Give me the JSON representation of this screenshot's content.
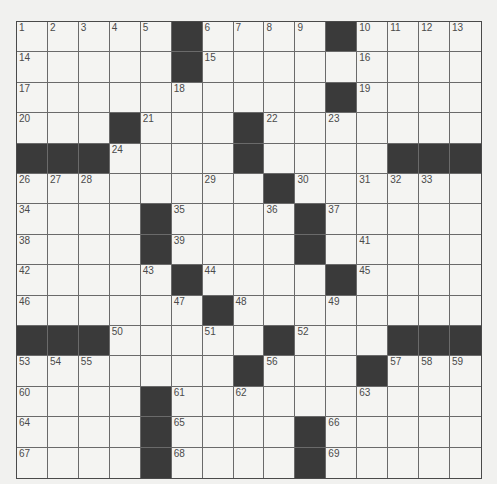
{
  "puzzle": {
    "rows": 15,
    "cols": 15,
    "colors": {
      "black_square": "#3a3a3a",
      "white_square": "#f4f4f2",
      "grid_line": "#6a6a6a",
      "number_text": "#4a4a4a"
    },
    "layout": [
      "#####.####.####",
      "#####.#########",
      "##########.####",
      "###.###.#######",
      "...####.####...",
      "########.######",
      "####.####.#####",
      "####.####.#####",
      "#####.####.####",
      "######.########",
      "...#####.###...",
      "#######.###.###",
      "####.##########",
      "####.####.#####",
      "####.####.#####"
    ],
    "numbers": [
      {
        "r": 0,
        "c": 0,
        "n": "1"
      },
      {
        "r": 0,
        "c": 1,
        "n": "2"
      },
      {
        "r": 0,
        "c": 2,
        "n": "3"
      },
      {
        "r": 0,
        "c": 3,
        "n": "4"
      },
      {
        "r": 0,
        "c": 4,
        "n": "5"
      },
      {
        "r": 0,
        "c": 6,
        "n": "6"
      },
      {
        "r": 0,
        "c": 7,
        "n": "7"
      },
      {
        "r": 0,
        "c": 8,
        "n": "8"
      },
      {
        "r": 0,
        "c": 9,
        "n": "9"
      },
      {
        "r": 0,
        "c": 11,
        "n": "10"
      },
      {
        "r": 0,
        "c": 12,
        "n": "11"
      },
      {
        "r": 0,
        "c": 13,
        "n": "12"
      },
      {
        "r": 0,
        "c": 14,
        "n": "13"
      },
      {
        "r": 1,
        "c": 0,
        "n": "14"
      },
      {
        "r": 1,
        "c": 6,
        "n": "15"
      },
      {
        "r": 1,
        "c": 11,
        "n": "16"
      },
      {
        "r": 2,
        "c": 0,
        "n": "17"
      },
      {
        "r": 2,
        "c": 5,
        "n": "18"
      },
      {
        "r": 2,
        "c": 11,
        "n": "19"
      },
      {
        "r": 3,
        "c": 0,
        "n": "20"
      },
      {
        "r": 3,
        "c": 4,
        "n": "21"
      },
      {
        "r": 3,
        "c": 8,
        "n": "22"
      },
      {
        "r": 3,
        "c": 10,
        "n": "23"
      },
      {
        "r": 4,
        "c": 3,
        "n": "24"
      },
      {
        "r": 4,
        "c": 7,
        "n": "25"
      },
      {
        "r": 5,
        "c": 0,
        "n": "26"
      },
      {
        "r": 5,
        "c": 1,
        "n": "27"
      },
      {
        "r": 5,
        "c": 2,
        "n": "28"
      },
      {
        "r": 5,
        "c": 6,
        "n": "29"
      },
      {
        "r": 5,
        "c": 9,
        "n": "30"
      },
      {
        "r": 5,
        "c": 11,
        "n": "31"
      },
      {
        "r": 5,
        "c": 12,
        "n": "32"
      },
      {
        "r": 5,
        "c": 13,
        "n": "33"
      },
      {
        "r": 6,
        "c": 0,
        "n": "34"
      },
      {
        "r": 6,
        "c": 5,
        "n": "35"
      },
      {
        "r": 6,
        "c": 8,
        "n": "36"
      },
      {
        "r": 6,
        "c": 10,
        "n": "37"
      },
      {
        "r": 7,
        "c": 0,
        "n": "38"
      },
      {
        "r": 7,
        "c": 5,
        "n": "39"
      },
      {
        "r": 7,
        "c": 9,
        "n": "40"
      },
      {
        "r": 7,
        "c": 11,
        "n": "41"
      },
      {
        "r": 8,
        "c": 0,
        "n": "42"
      },
      {
        "r": 8,
        "c": 4,
        "n": "43"
      },
      {
        "r": 8,
        "c": 6,
        "n": "44"
      },
      {
        "r": 8,
        "c": 11,
        "n": "45"
      },
      {
        "r": 9,
        "c": 0,
        "n": "46"
      },
      {
        "r": 9,
        "c": 5,
        "n": "47"
      },
      {
        "r": 9,
        "c": 7,
        "n": "48"
      },
      {
        "r": 9,
        "c": 10,
        "n": "49"
      },
      {
        "r": 10,
        "c": 3,
        "n": "50"
      },
      {
        "r": 10,
        "c": 6,
        "n": "51"
      },
      {
        "r": 10,
        "c": 9,
        "n": "52"
      },
      {
        "r": 11,
        "c": 0,
        "n": "53"
      },
      {
        "r": 11,
        "c": 1,
        "n": "54"
      },
      {
        "r": 11,
        "c": 2,
        "n": "55"
      },
      {
        "r": 11,
        "c": 8,
        "n": "56"
      },
      {
        "r": 11,
        "c": 12,
        "n": "57"
      },
      {
        "r": 11,
        "c": 13,
        "n": "58"
      },
      {
        "r": 11,
        "c": 14,
        "n": "59"
      },
      {
        "r": 12,
        "c": 0,
        "n": "60"
      },
      {
        "r": 12,
        "c": 5,
        "n": "61"
      },
      {
        "r": 12,
        "c": 7,
        "n": "62"
      },
      {
        "r": 12,
        "c": 11,
        "n": "63"
      },
      {
        "r": 13,
        "c": 0,
        "n": "64"
      },
      {
        "r": 13,
        "c": 5,
        "n": "65"
      },
      {
        "r": 13,
        "c": 10,
        "n": "66"
      },
      {
        "r": 14,
        "c": 0,
        "n": "67"
      },
      {
        "r": 14,
        "c": 5,
        "n": "68"
      },
      {
        "r": 14,
        "c": 10,
        "n": "69"
      }
    ]
  }
}
